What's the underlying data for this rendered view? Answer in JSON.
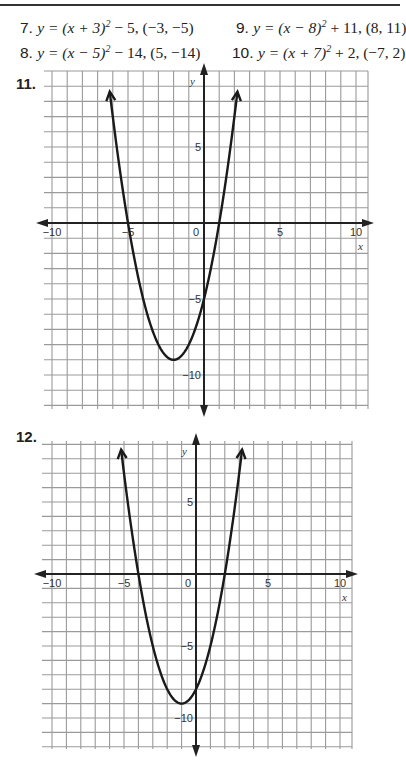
{
  "problems": [
    {
      "number": "7.",
      "equation_prefix": "y = (x + 3)",
      "exponent": "2",
      "equation_suffix": " − 5, (−3, −5)"
    },
    {
      "number": "8.",
      "equation_prefix": "y = (x − 5)",
      "exponent": "2",
      "equation_suffix": " − 14, (5, −14)"
    },
    {
      "number": "9.",
      "equation_prefix": "y = (x − 8)",
      "exponent": "2",
      "equation_suffix": " + 11, (8, 11)"
    },
    {
      "number": "10.",
      "equation_prefix": "y = (x + 7)",
      "exponent": "2",
      "equation_suffix": " + 2, (−7, 2)"
    }
  ],
  "graphs": [
    {
      "number": "11.",
      "x_axis_label": "x",
      "y_axis_label": "y",
      "x_tick_labels": [
        "−10",
        "−5",
        "0",
        "5",
        "10"
      ],
      "y_tick_labels": [
        "5",
        "−5",
        "−10"
      ]
    },
    {
      "number": "12.",
      "x_axis_label": "x",
      "y_axis_label": "y",
      "x_tick_labels": [
        "−10",
        "−5",
        "0",
        "5",
        "10"
      ],
      "y_tick_labels": [
        "5",
        "−5",
        "−10"
      ]
    }
  ],
  "chart_data": [
    {
      "type": "line",
      "title": "11.",
      "xlabel": "x",
      "ylabel": "y",
      "xlim": [
        -10,
        10
      ],
      "ylim": [
        -12,
        10
      ],
      "grid": true,
      "function": "y = (x + 2)^2 - 9",
      "vertex": [
        -2,
        -9
      ],
      "x_intercepts": [
        -5,
        1
      ],
      "y_intercept": -5,
      "x": [
        -6.2,
        -5,
        -4,
        -3,
        -2,
        -1,
        0,
        1,
        2.2
      ],
      "y": [
        8.64,
        0,
        -5,
        -8,
        -9,
        -8,
        -5,
        0,
        8.64
      ]
    },
    {
      "type": "line",
      "title": "12.",
      "xlabel": "x",
      "ylabel": "y",
      "xlim": [
        -10,
        10
      ],
      "ylim": [
        -12,
        9
      ],
      "grid": true,
      "function": "y = (x + 1)^2 - 9",
      "vertex": [
        -1,
        -9
      ],
      "x_intercepts": [
        -4,
        2
      ],
      "y_intercept": -8,
      "x": [
        -5.2,
        -4,
        -3,
        -2,
        -1,
        0,
        1,
        2,
        3.2
      ],
      "y": [
        8.64,
        0,
        -5,
        -8,
        -9,
        -8,
        -5,
        0,
        8.64
      ]
    }
  ]
}
